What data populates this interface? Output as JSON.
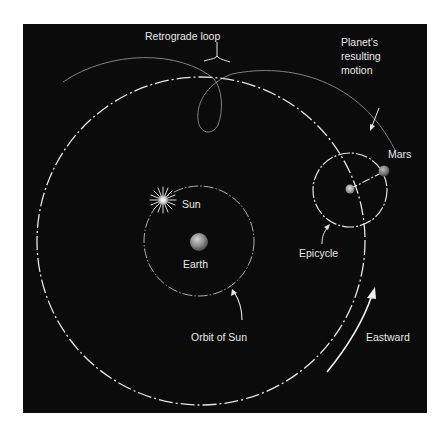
{
  "diagram": {
    "background_color": "#0b0b0b",
    "line_color": "#e8e8e8",
    "labels": {
      "retrograde_loop": "Retrograde loop",
      "planet_motion_line1": "Planet's",
      "planet_motion_line2": "resulting",
      "planet_motion_line3": "motion",
      "mars": "Mars",
      "sun": "Sun",
      "earth": "Earth",
      "epicycle": "Epicycle",
      "orbit_of_sun": "Orbit of Sun",
      "eastward": "Eastward"
    },
    "bodies": [
      {
        "name": "Earth",
        "icon": "earth-icon"
      },
      {
        "name": "Sun",
        "icon": "sun-icon"
      },
      {
        "name": "Mars",
        "icon": "mars-icon"
      }
    ]
  }
}
